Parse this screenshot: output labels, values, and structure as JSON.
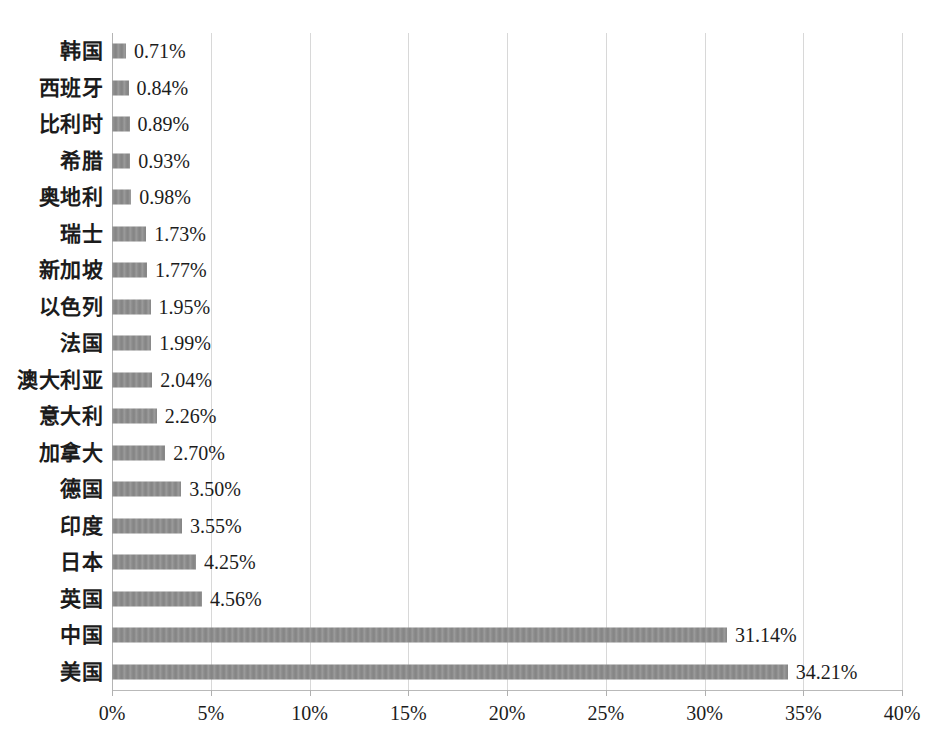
{
  "chart_data": {
    "type": "bar",
    "orientation": "horizontal",
    "title": "",
    "subtitle": "",
    "xlabel": "",
    "ylabel": "",
    "xlim": [
      0,
      40
    ],
    "xtick_labels": [
      "0%",
      "5%",
      "10%",
      "15%",
      "20%",
      "25%",
      "30%",
      "35%",
      "40%"
    ],
    "xtick_values": [
      0,
      5,
      10,
      15,
      20,
      25,
      30,
      35,
      40
    ],
    "grid": "vertical",
    "legend": "none",
    "value_label_suffix": "%",
    "bar_color": "#8c8c8c",
    "categories": [
      "韩国",
      "西班牙",
      "比利时",
      "希腊",
      "奥地利",
      "瑞士",
      "新加坡",
      "以色列",
      "法国",
      "澳大利亚",
      "意大利",
      "加拿大",
      "德国",
      "印度",
      "日本",
      "英国",
      "中国",
      "美国"
    ],
    "values": [
      0.71,
      0.84,
      0.89,
      0.93,
      0.98,
      1.73,
      1.77,
      1.95,
      1.99,
      2.04,
      2.26,
      2.7,
      3.5,
      3.55,
      4.25,
      4.56,
      31.14,
      34.21
    ],
    "value_labels": [
      "0.71%",
      "0.84%",
      "0.89%",
      "0.93%",
      "0.98%",
      "1.73%",
      "1.77%",
      "1.95%",
      "1.99%",
      "2.04%",
      "2.26%",
      "2.70%",
      "3.50%",
      "3.55%",
      "4.25%",
      "4.56%",
      "31.14%",
      "34.21%"
    ]
  }
}
